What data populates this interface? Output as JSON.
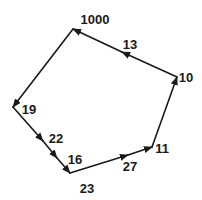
{
  "diagram": {
    "background_color": "#ffffff",
    "line_color": "#1a1a1a",
    "text_color": "#1a1a1a",
    "labels": {
      "n1000": "1000",
      "n13": "13",
      "n10": "10",
      "n11": "11",
      "n27": "27",
      "n23": "23",
      "n16": "16",
      "n22": "22",
      "n19": "19"
    },
    "arrow_cycle": [
      "1000",
      "19",
      "22",
      "16",
      "23",
      "27",
      "11",
      "10",
      "13",
      "1000"
    ]
  }
}
